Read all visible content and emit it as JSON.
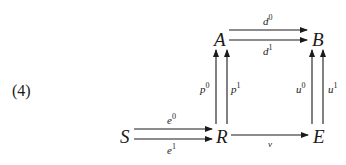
{
  "equation_number": "(4)",
  "nodes": {
    "A": "A",
    "B": "B",
    "S": "S",
    "R": "R",
    "E": "E"
  },
  "arrows": {
    "d0": {
      "base": "d",
      "sup": "0"
    },
    "d1": {
      "base": "d",
      "sup": "1"
    },
    "p0": {
      "base": "p",
      "sup": "0"
    },
    "p1": {
      "base": "p",
      "sup": "1"
    },
    "u0": {
      "base": "u",
      "sup": "0"
    },
    "u1": {
      "base": "u",
      "sup": "1"
    },
    "e0": {
      "base": "e",
      "sup": "0"
    },
    "e1": {
      "base": "e",
      "sup": "1"
    },
    "v": {
      "base": "v"
    }
  },
  "colors": {
    "ink": "#1a1a1a",
    "background": "#ffffff"
  }
}
